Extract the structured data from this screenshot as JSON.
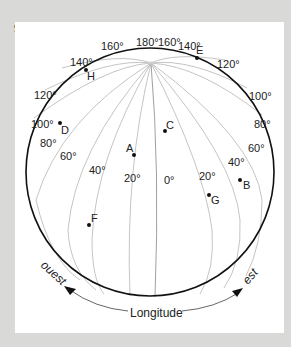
{
  "exercise": {
    "number": "97"
  },
  "globe": {
    "rim_labels": {
      "top_180": "180°",
      "top_left_160": "160°",
      "top_right_160": "160°",
      "left_140": "140°",
      "right_140": "140°",
      "left_120": "120°",
      "right_120": "120°",
      "left_100": "100°",
      "right_100": "100°"
    },
    "meridian_labels": {
      "west_80": "80°",
      "west_60": "60°",
      "west_40": "40°",
      "west_20": "20°",
      "zero": "0°",
      "east_20": "20°",
      "east_40": "40°",
      "east_60": "60°",
      "east_80": "80°"
    },
    "points": [
      {
        "id": "A",
        "label": "A"
      },
      {
        "id": "B",
        "label": "B"
      },
      {
        "id": "C",
        "label": "C"
      },
      {
        "id": "D",
        "label": "D"
      },
      {
        "id": "E",
        "label": "E"
      },
      {
        "id": "F",
        "label": "F"
      },
      {
        "id": "G",
        "label": "G"
      },
      {
        "id": "H",
        "label": "H"
      }
    ]
  },
  "axis": {
    "west_label": "ouest",
    "east_label": "est",
    "title": "Longitude"
  }
}
